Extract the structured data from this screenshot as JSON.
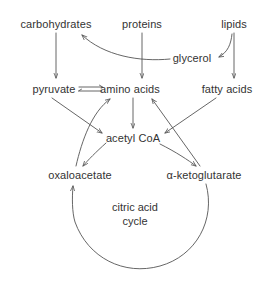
{
  "diagram": {
    "colors": {
      "background": "#ffffff",
      "text": "#333333",
      "stroke": "#555555"
    },
    "nodes": [
      {
        "id": "carbohydrates",
        "label": "carbohydrates",
        "x": 56,
        "y": 24
      },
      {
        "id": "proteins",
        "label": "proteins",
        "x": 142,
        "y": 24
      },
      {
        "id": "lipids",
        "label": "lipids",
        "x": 234,
        "y": 24
      },
      {
        "id": "glycerol",
        "label": "glycerol",
        "x": 192,
        "y": 58
      },
      {
        "id": "pyruvate",
        "label": "pyruvate",
        "x": 54,
        "y": 89
      },
      {
        "id": "amino-acids",
        "label": "amino acids",
        "x": 130,
        "y": 89
      },
      {
        "id": "fatty-acids",
        "label": "fatty acids",
        "x": 227,
        "y": 89
      },
      {
        "id": "acetyl-coa",
        "label": "acetyl CoA",
        "x": 133,
        "y": 138
      },
      {
        "id": "oxaloacetate",
        "label": "oxaloacetate",
        "x": 80,
        "y": 175
      },
      {
        "id": "alpha-ketoglutarate",
        "label": "α-ketoglutarate",
        "x": 204,
        "y": 175
      }
    ],
    "cycle": {
      "line1": "citric acid",
      "line2": "cycle",
      "center_x": 135,
      "line1_y": 207,
      "line2_y": 221
    },
    "edges": [
      {
        "id": "carbohydrates-to-pyruvate",
        "from": "carbohydrates",
        "to": "pyruvate",
        "kind": "straight-arrow"
      },
      {
        "id": "proteins-to-amino-acids",
        "from": "proteins",
        "to": "amino acids",
        "kind": "straight-arrow"
      },
      {
        "id": "lipids-to-glycerol",
        "from": "lipids",
        "to": "glycerol",
        "kind": "curved-arrow"
      },
      {
        "id": "lipids-to-fatty-acids",
        "from": "lipids",
        "to": "fatty acids",
        "kind": "straight-arrow"
      },
      {
        "id": "glycerol-to-carbohydrates",
        "from": "glycerol",
        "to": "carbohydrates",
        "kind": "curved-arrow"
      },
      {
        "id": "pyruvate-amino-acids-reversible",
        "from": "pyruvate",
        "to": "amino acids",
        "kind": "equilibrium"
      },
      {
        "id": "pyruvate-to-acetyl-coa",
        "from": "pyruvate",
        "to": "acetyl CoA",
        "kind": "straight-arrow"
      },
      {
        "id": "amino-acids-to-acetyl-coa",
        "from": "amino acids",
        "to": "acetyl CoA",
        "kind": "straight-arrow"
      },
      {
        "id": "fatty-acids-to-acetyl-coa",
        "from": "fatty acids",
        "to": "acetyl CoA",
        "kind": "straight-arrow"
      },
      {
        "id": "oxaloacetate-to-amino-acids",
        "from": "oxaloacetate",
        "to": "amino acids",
        "kind": "curved-arrow"
      },
      {
        "id": "alpha-ketoglutarate-to-amino-acids",
        "from": "α-ketoglutarate",
        "to": "amino acids",
        "kind": "straight-arrow"
      },
      {
        "id": "acetyl-coa-to-oxaloacetate",
        "from": "acetyl CoA",
        "to": "oxaloacetate",
        "kind": "curved-arrow"
      },
      {
        "id": "acetyl-coa-to-alpha-ketoglutarate",
        "from": "acetyl CoA",
        "to": "α-ketoglutarate",
        "kind": "curved-arrow"
      },
      {
        "id": "citric-acid-cycle-arc",
        "from": "α-ketoglutarate",
        "to": "oxaloacetate",
        "kind": "arc-arrow"
      }
    ]
  }
}
